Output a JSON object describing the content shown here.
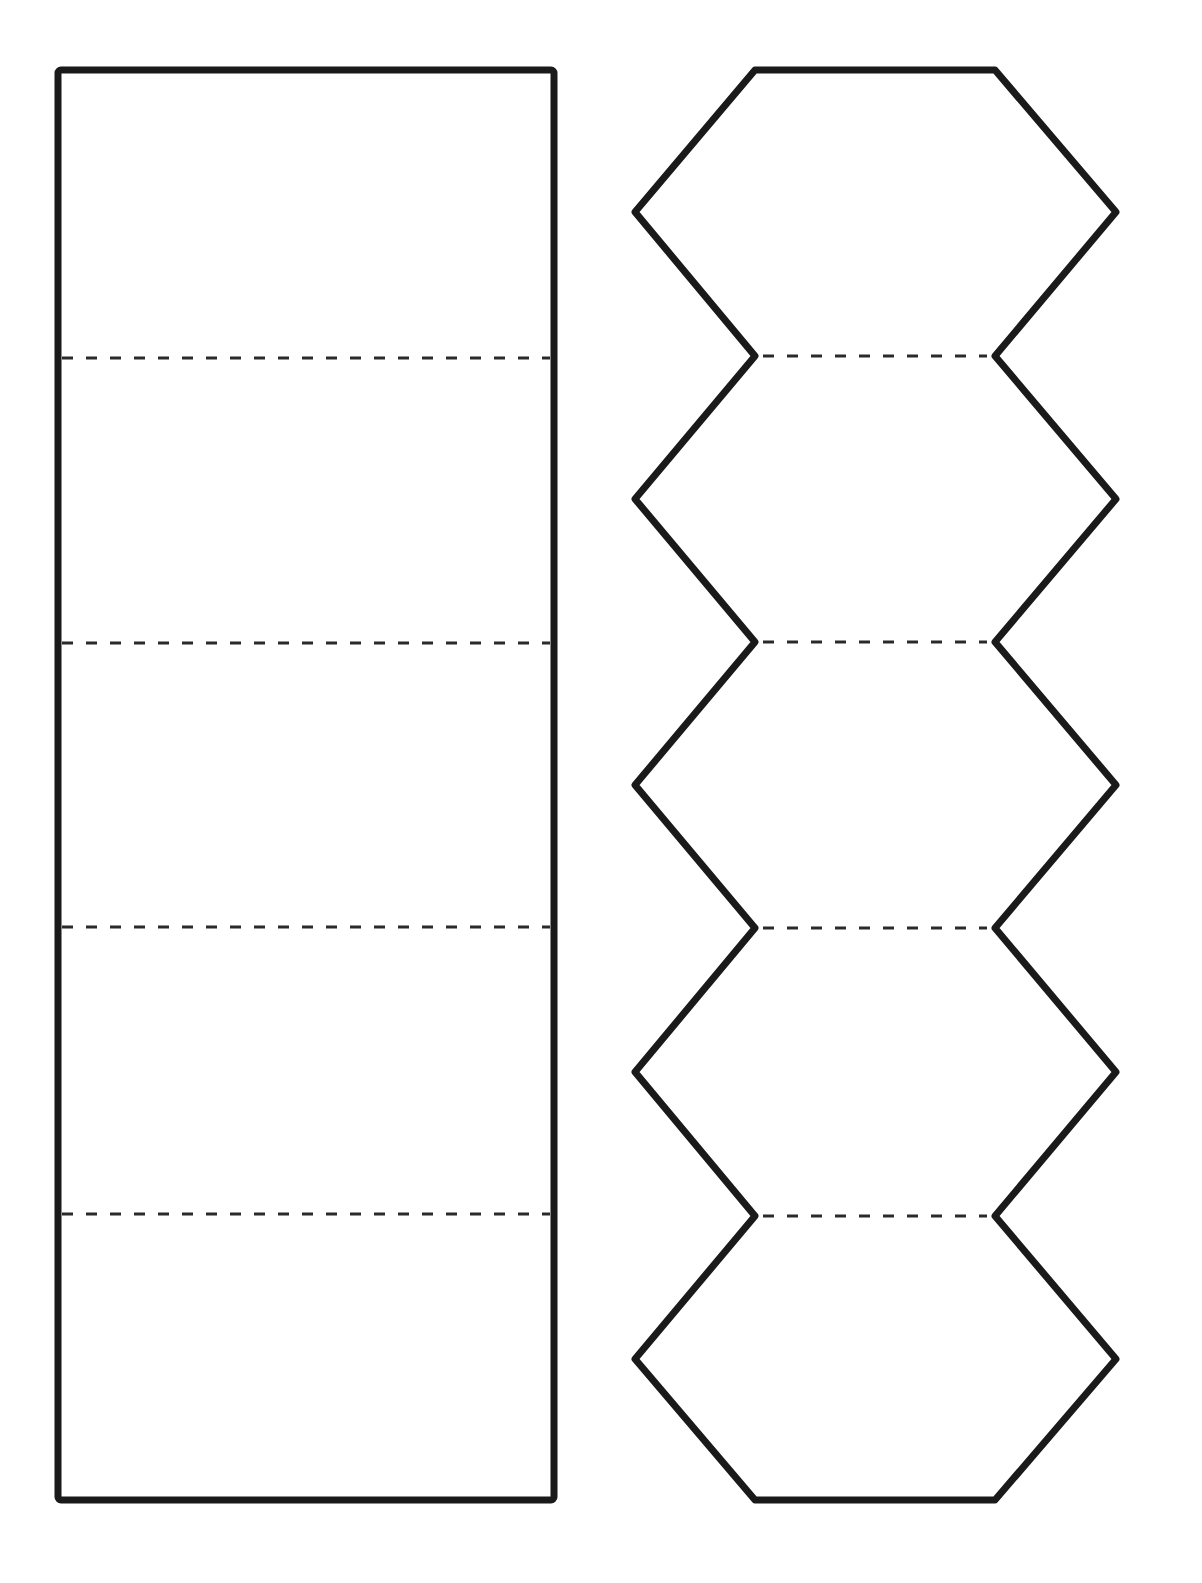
{
  "diagram": {
    "stroke_color": "#1a1a1a",
    "dash_color": "#2a2a2a",
    "background": "#ffffff",
    "rectangle_strip": {
      "x": 58,
      "y": 70,
      "width": 496,
      "height": 1430,
      "sections": 5,
      "fold_lines_y": [
        358,
        643,
        927,
        1214
      ]
    },
    "hexagon_chain": {
      "count": 5,
      "left_x": 635,
      "right_x": 1116,
      "inner_left_x": 755,
      "inner_right_x": 995,
      "top_y": 70,
      "bottom_y": 1500,
      "joint_y": [
        356,
        642,
        928,
        1216
      ],
      "mid_y": [
        212,
        499,
        785,
        1072,
        1359
      ]
    }
  }
}
